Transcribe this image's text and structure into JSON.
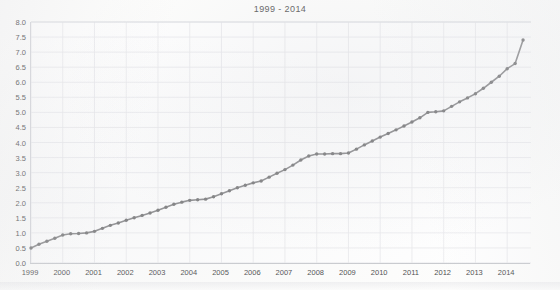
{
  "chart_data": {
    "type": "line",
    "title": "1999 - 2014",
    "xlabel": "",
    "ylabel": "",
    "xlim": [
      1999,
      2014.75
    ],
    "ylim": [
      0.0,
      8.0
    ],
    "grid": true,
    "legend": "none",
    "marker": "circle",
    "line_color": "#8a8a8c",
    "marker_color": "#787879",
    "grid_color": "#e8e9ec",
    "axis_color": "#c9cbcf",
    "ytick_labels": [
      "0.0",
      "0.5",
      "1.0",
      "1.5",
      "2.0",
      "2.5",
      "3.0",
      "3.5",
      "4.0",
      "4.5",
      "5.0",
      "5.5",
      "6.0",
      "6.5",
      "7.0",
      "7.5",
      "8.0"
    ],
    "ytick_values": [
      0.0,
      0.5,
      1.0,
      1.5,
      2.0,
      2.5,
      3.0,
      3.5,
      4.0,
      4.5,
      5.0,
      5.5,
      6.0,
      6.5,
      7.0,
      7.5,
      8.0
    ],
    "xtick_labels": [
      "1999",
      "2000",
      "2001",
      "2002",
      "2003",
      "2004",
      "2005",
      "2006",
      "2007",
      "2008",
      "2009",
      "2010",
      "2011",
      "2012",
      "2013",
      "2014"
    ],
    "xtick_values": [
      1999,
      2000,
      2001,
      2002,
      2003,
      2004,
      2005,
      2006,
      2007,
      2008,
      2009,
      2010,
      2011,
      2012,
      2013,
      2014
    ],
    "series": [
      {
        "name": "series-1",
        "x": [
          1999.0,
          1999.25,
          1999.5,
          1999.75,
          2000.0,
          2000.25,
          2000.5,
          2000.75,
          2001.0,
          2001.25,
          2001.5,
          2001.75,
          2002.0,
          2002.25,
          2002.5,
          2002.75,
          2003.0,
          2003.25,
          2003.5,
          2003.75,
          2004.0,
          2004.25,
          2004.5,
          2004.75,
          2005.0,
          2005.25,
          2005.5,
          2005.75,
          2006.0,
          2006.25,
          2006.5,
          2006.75,
          2007.0,
          2007.25,
          2007.5,
          2007.75,
          2008.0,
          2008.25,
          2008.5,
          2008.75,
          2009.0,
          2009.25,
          2009.5,
          2009.75,
          2010.0,
          2010.25,
          2010.5,
          2010.75,
          2011.0,
          2011.25,
          2011.5,
          2011.75,
          2012.0,
          2012.25,
          2012.5,
          2012.75,
          2013.0,
          2013.25,
          2013.5,
          2013.75,
          2014.0,
          2014.25,
          2014.5
        ],
        "values": [
          0.5,
          0.62,
          0.72,
          0.82,
          0.93,
          0.97,
          0.98,
          1.0,
          1.05,
          1.15,
          1.25,
          1.33,
          1.42,
          1.5,
          1.58,
          1.66,
          1.75,
          1.85,
          1.95,
          2.02,
          2.08,
          2.1,
          2.12,
          2.2,
          2.3,
          2.4,
          2.5,
          2.58,
          2.66,
          2.72,
          2.85,
          2.98,
          3.1,
          3.25,
          3.42,
          3.55,
          3.62,
          3.62,
          3.63,
          3.63,
          3.65,
          3.78,
          3.92,
          4.05,
          4.18,
          4.3,
          4.42,
          4.55,
          4.68,
          4.82,
          5.0,
          5.02,
          5.05,
          5.2,
          5.35,
          5.48,
          5.62,
          5.8,
          6.0,
          6.2,
          6.45,
          6.62,
          7.4
        ]
      }
    ]
  },
  "axis": {
    "y_title": "",
    "x_title": ""
  }
}
